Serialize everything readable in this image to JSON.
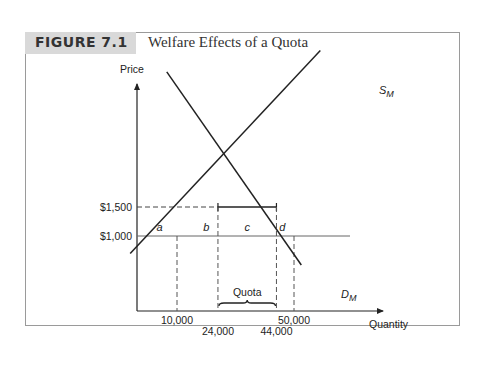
{
  "figure": {
    "label": "FIGURE 7.1",
    "title": "Welfare Effects of a Quota"
  },
  "chart_data": {
    "type": "line",
    "title": "Welfare Effects of a Quota",
    "xlabel": "Quantity",
    "ylabel": "Price",
    "x_ticks": [
      {
        "value": 10000,
        "label": "10,000"
      },
      {
        "value": 24000,
        "label": "24,000"
      },
      {
        "value": 44000,
        "label": "44,000"
      },
      {
        "value": 50000,
        "label": "50,000"
      }
    ],
    "y_ticks": [
      {
        "value": 1000,
        "label": "$1,000"
      },
      {
        "value": 1500,
        "label": "$1,500"
      }
    ],
    "xlim": [
      0,
      70000
    ],
    "ylim": [
      0,
      3750
    ],
    "grid": false,
    "series": [
      {
        "name": "S_M",
        "label_main": "S",
        "label_sub": "M",
        "points": [
          [
            -6000,
            700
          ],
          [
            59000,
            4200
          ]
        ]
      },
      {
        "name": "D_M",
        "label_main": "D",
        "label_sub": "M",
        "points": [
          [
            6500,
            3830
          ],
          [
            52500,
            500
          ]
        ]
      }
    ],
    "reference_lines": {
      "world_price": 1000,
      "quota_price": 1500,
      "quota_start": 24000,
      "quota_end": 44000,
      "dashed_verticals": [
        10000,
        24000,
        44000,
        50000
      ]
    },
    "annotations": [
      {
        "text": "a",
        "x": 4000,
        "y": 1100
      },
      {
        "text": "b",
        "x": 20000,
        "y": 1100
      },
      {
        "text": "c",
        "x": 34000,
        "y": 1100
      },
      {
        "text": "d",
        "x": 46000,
        "y": 1100
      },
      {
        "text": "Quota",
        "x": 34000,
        "y": 400
      }
    ]
  }
}
